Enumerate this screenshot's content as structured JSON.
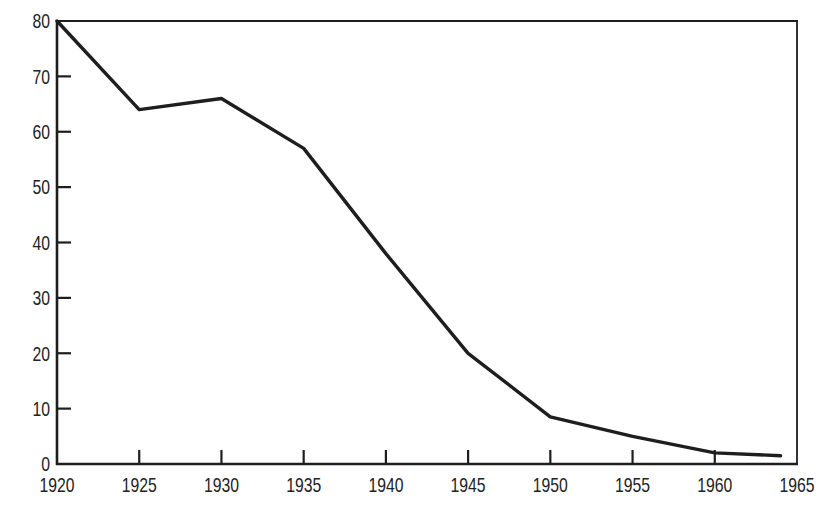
{
  "chart_data": {
    "type": "line",
    "x": [
      1920,
      1925,
      1930,
      1935,
      1940,
      1945,
      1950,
      1955,
      1960,
      1964
    ],
    "series": [
      {
        "values": [
          80,
          64,
          66,
          57,
          38,
          20,
          8.5,
          5,
          2,
          1.5
        ]
      }
    ],
    "xlim": [
      1920,
      1965
    ],
    "ylim": [
      0,
      80
    ],
    "x_ticks": {
      "values": [
        1920,
        1925,
        1930,
        1935,
        1940,
        1945,
        1950,
        1955,
        1960,
        1965
      ],
      "labels": [
        "1920",
        "1925",
        "1930",
        "1935",
        "1940",
        "1945",
        "1950",
        "1955",
        "1960",
        "1965"
      ]
    },
    "y_ticks": {
      "values": [
        0,
        10,
        20,
        30,
        40,
        50,
        60,
        70,
        80
      ],
      "labels": [
        "0",
        "10",
        "20",
        "30",
        "40",
        "50",
        "60",
        "70",
        "80"
      ]
    },
    "grid": false,
    "legend": false,
    "frame": "box",
    "line_color": "#1e1e1e",
    "axis_color": "#1e1e1e",
    "background": "#ffffff"
  }
}
